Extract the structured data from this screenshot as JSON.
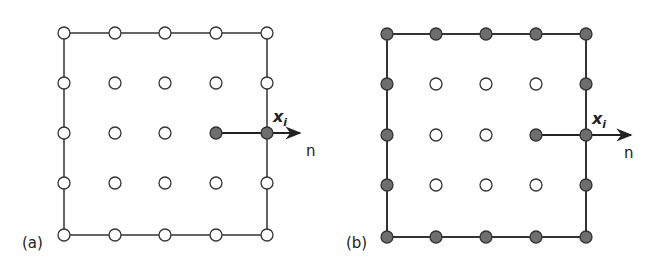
{
  "panels": [
    {
      "label": "(a)",
      "node_label": "x",
      "node_sub": "i",
      "normal_label": "n",
      "grid": {
        "cols": 5,
        "rows": 5
      },
      "filled_nodes": [
        "row3-col4",
        "row3-col5"
      ],
      "boundary_filled": false
    },
    {
      "label": "(b)",
      "node_label": "x",
      "node_sub": "i",
      "normal_label": "n",
      "grid": {
        "cols": 5,
        "rows": 5
      },
      "filled_nodes": [
        "all-boundary",
        "row3-col4"
      ],
      "boundary_filled": true
    }
  ],
  "colors": {
    "filled": "#6e6e6e",
    "outline": "#333333",
    "empty": "#ffffff",
    "background": "#ffffff"
  }
}
